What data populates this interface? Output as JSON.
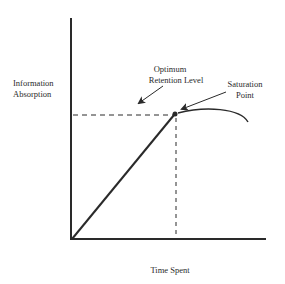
{
  "diagram": {
    "type": "line-graph",
    "y_axis_label": [
      "Information",
      "Absorption"
    ],
    "x_axis_label": "Time Spent",
    "annotations": {
      "optimum": [
        "Optimum",
        "Retention Level"
      ],
      "saturation": [
        "Saturation",
        "Point"
      ]
    },
    "colors": {
      "ink": "#2a2a2a",
      "background": "#ffffff"
    }
  }
}
